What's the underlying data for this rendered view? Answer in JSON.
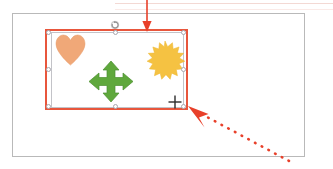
{
  "scene": {
    "app_context": "slide-editor-canvas",
    "background_color": "#ffffff"
  },
  "top_rule": {
    "name": "page-top-divider",
    "color": "#f3d9d4"
  },
  "slide_frame": {
    "name": "slide-canvas",
    "border_color": "#b9b9b9",
    "background_color": "#ffffff"
  },
  "selection": {
    "label": "Group selection",
    "border_color": "#e8563c",
    "inner_border_color": "#c3c3c8",
    "handle_fill": "#ffffff",
    "handle_border": "#a8a8b0",
    "handles": [
      {
        "name": "handle-top-left",
        "x": 48,
        "y": 32
      },
      {
        "name": "handle-top-center",
        "x": 114,
        "y": 32
      },
      {
        "name": "handle-top-right",
        "x": 181,
        "y": 32
      },
      {
        "name": "handle-middle-left",
        "x": 48,
        "y": 69
      },
      {
        "name": "handle-middle-right",
        "x": 181,
        "y": 69
      },
      {
        "name": "handle-bottom-left",
        "x": 48,
        "y": 105
      },
      {
        "name": "handle-bottom-center",
        "x": 114,
        "y": 105
      },
      {
        "name": "handle-bottom-right",
        "x": 181,
        "y": 105
      }
    ],
    "rotate_handle": {
      "name": "rotate-handle",
      "color": "#9a9a9a",
      "title": "Rotate"
    }
  },
  "shapes": [
    {
      "id": "heart",
      "icon": "heart-shape",
      "label": "Heart",
      "fill": "#F0A878",
      "stroke": "#E79A68"
    },
    {
      "id": "arrow-4way",
      "icon": "four-way-arrow-shape",
      "label": "Four-way arrow",
      "fill": "#5FA83C",
      "stroke": "#4C8F30"
    },
    {
      "id": "sun",
      "icon": "sun-burst-shape",
      "label": "Sun",
      "fill": "#F5C242",
      "stroke": "#EDB730"
    }
  ],
  "cursor": {
    "name": "crosshair-cursor",
    "icon": "crosshair-icon",
    "color": "#2b2b2b"
  },
  "annotations": [
    {
      "id": "top-arrow",
      "name": "annotation-arrow-top",
      "style": "solid",
      "direction": "down",
      "color": "#E8402A"
    },
    {
      "id": "dotted-arrow",
      "name": "annotation-arrow-dotted",
      "style": "dotted",
      "direction": "up-left",
      "color": "#E8402A"
    }
  ]
}
